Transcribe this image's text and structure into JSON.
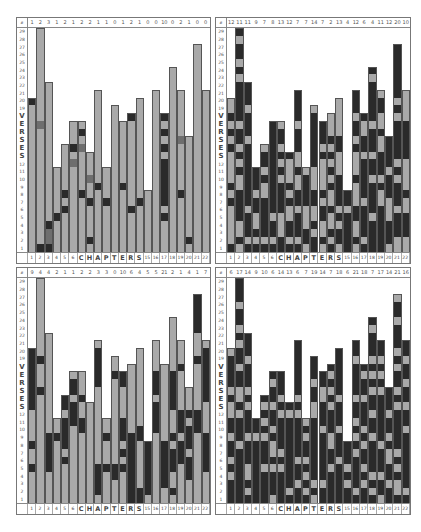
{
  "chart_data": {
    "type": "heatmap",
    "title": "",
    "xlabel": "CHAPTERS",
    "ylabel": "VERSES",
    "x_ticks": [
      "1",
      "2",
      "3",
      "4",
      "5",
      "6",
      "C",
      "H",
      "A",
      "P",
      "T",
      "E",
      "R",
      "S",
      "15",
      "16",
      "17",
      "18",
      "19",
      "20",
      "21",
      "22"
    ],
    "y_ticks": [
      "1",
      "2",
      "3",
      "4",
      "5",
      "6",
      "7",
      "8",
      "9",
      "10",
      "11",
      "12",
      "S",
      "E",
      "S",
      "R",
      "E",
      "V",
      "19",
      "20",
      "21",
      "22",
      "23",
      "24",
      "25",
      "26",
      "27",
      "28",
      "29"
    ],
    "verses_per_chapter": [
      20,
      29,
      22,
      11,
      14,
      17,
      17,
      13,
      21,
      11,
      19,
      17,
      18,
      20,
      8,
      21,
      18,
      24,
      21,
      15,
      27,
      21
    ],
    "legend": {
      "light": "#a9a9a9",
      "dark": "#2a2a2a",
      "medium": "#6e6e6e",
      "empty": "#ffffff"
    },
    "panels": [
      {
        "name": "top-left",
        "header_counts": [
          "1",
          "2",
          "3",
          "1",
          "2",
          "1",
          "2",
          "2",
          "1",
          "1",
          "0",
          "1",
          "2",
          "1",
          "0",
          "0",
          "10",
          "0",
          "2",
          "1",
          "0",
          "0"
        ],
        "corner_label": "#",
        "dark_cells": [
          [
            1,
            20
          ],
          [
            2,
            1
          ],
          [
            3,
            1
          ],
          [
            3,
            4
          ],
          [
            4,
            5
          ],
          [
            5,
            6
          ],
          [
            5,
            8
          ],
          [
            6,
            14
          ],
          [
            7,
            16
          ],
          [
            7,
            8
          ],
          [
            8,
            2
          ],
          [
            8,
            7
          ],
          [
            9,
            9
          ],
          [
            10,
            7
          ],
          [
            12,
            9
          ],
          [
            13,
            6
          ],
          [
            13,
            18
          ],
          [
            14,
            7
          ],
          [
            17,
            5
          ],
          [
            17,
            7
          ],
          [
            17,
            8
          ],
          [
            17,
            9
          ],
          [
            17,
            10
          ],
          [
            17,
            11
          ],
          [
            17,
            12
          ],
          [
            17,
            14
          ],
          [
            17,
            16
          ],
          [
            17,
            18
          ],
          [
            19,
            8
          ],
          [
            20,
            2
          ]
        ],
        "medium_cells": [
          [
            2,
            17
          ],
          [
            3,
            2
          ],
          [
            3,
            3
          ],
          [
            7,
            14
          ],
          [
            8,
            10
          ],
          [
            6,
            12
          ],
          [
            19,
            15
          ]
        ]
      },
      {
        "name": "top-right",
        "header_counts": [
          "12",
          "11",
          "11",
          "9",
          "7",
          "8",
          "13",
          "12",
          "7",
          "7",
          "14",
          "7",
          "2",
          "13",
          "4",
          "12",
          "6",
          "4",
          "11",
          "12",
          "20",
          "10"
        ],
        "corner_label": "#",
        "dark_density": 0.62
      },
      {
        "name": "bottom-left",
        "header_counts": [
          "9",
          "4",
          "4",
          "2",
          "1",
          "1",
          "2",
          "2",
          "3",
          "3",
          "0",
          "10",
          "6",
          "4",
          "5",
          "5",
          "21",
          "2",
          "1",
          "4",
          "1",
          "7"
        ],
        "corner_label": "#",
        "dark_density": 0.28
      },
      {
        "name": "bottom-right",
        "header_counts": [
          "6",
          "17",
          "14",
          "9",
          "10",
          "6",
          "14",
          "13",
          "6",
          "7",
          "19",
          "14",
          "7",
          "18",
          "6",
          "21",
          "18",
          "7",
          "17",
          "14",
          "21",
          "16"
        ],
        "corner_label": "#",
        "dark_density": 0.72
      }
    ]
  }
}
